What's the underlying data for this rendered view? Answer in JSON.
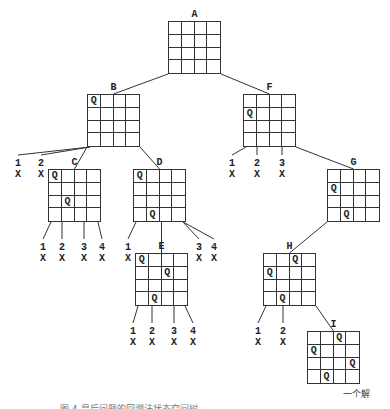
{
  "diagram": {
    "nodes": [
      {
        "id": "A",
        "label": "A",
        "x": 168,
        "y": 21,
        "size": 53,
        "queens": []
      },
      {
        "id": "B",
        "label": "B",
        "x": 87,
        "y": 94,
        "size": 53,
        "queens": [
          [
            0,
            0
          ]
        ]
      },
      {
        "id": "F",
        "label": "F",
        "x": 243,
        "y": 94,
        "size": 53,
        "queens": [
          [
            1,
            0
          ]
        ]
      },
      {
        "id": "C",
        "label": "C",
        "x": 48,
        "y": 169,
        "size": 53,
        "queens": [
          [
            0,
            0
          ],
          [
            2,
            1
          ]
        ]
      },
      {
        "id": "D",
        "label": "D",
        "x": 133,
        "y": 169,
        "size": 53,
        "queens": [
          [
            0,
            0
          ],
          [
            3,
            1
          ]
        ]
      },
      {
        "id": "G",
        "label": "G",
        "x": 327,
        "y": 169,
        "size": 53,
        "queens": [
          [
            1,
            0
          ],
          [
            3,
            1
          ]
        ]
      },
      {
        "id": "E",
        "label": "E",
        "x": 135,
        "y": 253,
        "size": 53,
        "queens": [
          [
            0,
            0
          ],
          [
            1,
            2
          ],
          [
            3,
            1
          ]
        ]
      },
      {
        "id": "H",
        "label": "H",
        "x": 263,
        "y": 253,
        "size": 53,
        "queens": [
          [
            0,
            2
          ],
          [
            1,
            0
          ],
          [
            3,
            1
          ]
        ]
      },
      {
        "id": "I",
        "label": "I",
        "x": 307,
        "y": 331,
        "size": 53,
        "queens": [
          [
            0,
            2
          ],
          [
            1,
            0
          ],
          [
            2,
            3
          ],
          [
            3,
            1
          ]
        ]
      }
    ],
    "edges": [
      [
        "A",
        "B"
      ],
      [
        "A",
        "F"
      ],
      [
        "B",
        "C"
      ],
      [
        "B",
        "D"
      ],
      [
        "F",
        "G"
      ],
      [
        "D",
        "E"
      ],
      [
        "G",
        "H"
      ],
      [
        "H",
        "I"
      ]
    ],
    "failed_leaves": [
      {
        "parent": "B",
        "num": "1",
        "mark": "X",
        "x": 13,
        "y": 158
      },
      {
        "parent": "B",
        "num": "2",
        "mark": "X",
        "x": 36,
        "y": 158
      },
      {
        "parent": "C",
        "num": "1",
        "mark": "X",
        "x": 38,
        "y": 242
      },
      {
        "parent": "C",
        "num": "2",
        "mark": "X",
        "x": 57,
        "y": 242
      },
      {
        "parent": "C",
        "num": "3",
        "mark": "X",
        "x": 79,
        "y": 242
      },
      {
        "parent": "C",
        "num": "4",
        "mark": "X",
        "x": 97,
        "y": 242
      },
      {
        "parent": "D",
        "num": "1",
        "mark": "X",
        "x": 123,
        "y": 242
      },
      {
        "parent": "D",
        "num": "3",
        "mark": "X",
        "x": 194,
        "y": 242
      },
      {
        "parent": "D",
        "num": "4",
        "mark": "X",
        "x": 209,
        "y": 242
      },
      {
        "parent": "E",
        "num": "1",
        "mark": "X",
        "x": 128,
        "y": 326
      },
      {
        "parent": "E",
        "num": "2",
        "mark": "X",
        "x": 147,
        "y": 326
      },
      {
        "parent": "E",
        "num": "3",
        "mark": "X",
        "x": 169,
        "y": 326
      },
      {
        "parent": "E",
        "num": "4",
        "mark": "X",
        "x": 188,
        "y": 326
      },
      {
        "parent": "F",
        "num": "1",
        "mark": "X",
        "x": 227,
        "y": 158
      },
      {
        "parent": "F",
        "num": "2",
        "mark": "X",
        "x": 252,
        "y": 158
      },
      {
        "parent": "F",
        "num": "3",
        "mark": "X",
        "x": 277,
        "y": 158
      },
      {
        "parent": "H",
        "num": "1",
        "mark": "X",
        "x": 253,
        "y": 326
      },
      {
        "parent": "H",
        "num": "2",
        "mark": "X",
        "x": 278,
        "y": 326
      }
    ],
    "queen_symbol": "Q",
    "solution_note": "一个解",
    "caption": "图 4-皇后问题的回溯法状态空间树"
  }
}
